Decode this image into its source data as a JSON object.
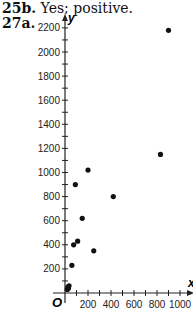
{
  "answers": [
    {
      "label": "25b.",
      "text": "Yes; positive."
    },
    {
      "label": "27a.",
      "text": ""
    }
  ],
  "chart_data": {
    "type": "scatter",
    "title": "",
    "xlabel": "x",
    "ylabel": "y",
    "origin_label": "O",
    "xlim": [
      0,
      1000
    ],
    "ylim": [
      0,
      2200
    ],
    "x_ticks": [
      200,
      400,
      600,
      800,
      1000
    ],
    "y_ticks": [
      200,
      400,
      600,
      800,
      1000,
      1200,
      1400,
      1600,
      1800,
      2000,
      2200
    ],
    "grid": false,
    "points": [
      {
        "x": 20,
        "y": 30
      },
      {
        "x": 25,
        "y": 50
      },
      {
        "x": 30,
        "y": 40
      },
      {
        "x": 35,
        "y": 60
      },
      {
        "x": 60,
        "y": 230
      },
      {
        "x": 75,
        "y": 400
      },
      {
        "x": 90,
        "y": 900
      },
      {
        "x": 110,
        "y": 430
      },
      {
        "x": 150,
        "y": 620
      },
      {
        "x": 200,
        "y": 1020
      },
      {
        "x": 250,
        "y": 350
      },
      {
        "x": 420,
        "y": 800
      },
      {
        "x": 830,
        "y": 1150
      },
      {
        "x": 900,
        "y": 2180
      }
    ]
  }
}
